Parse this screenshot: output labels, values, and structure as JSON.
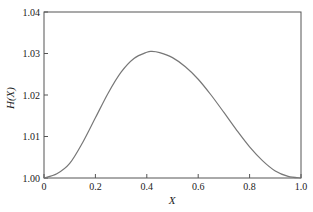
{
  "chart_data": {
    "type": "line",
    "title": "",
    "xlabel": "X",
    "ylabel": "H(X)",
    "xlim": [
      0,
      1.0
    ],
    "ylim": [
      1.0,
      1.04
    ],
    "xticks": [
      "0",
      "0.2",
      "0.4",
      "0.6",
      "0.8",
      "1.0"
    ],
    "yticks": [
      "1.00",
      "1.01",
      "1.02",
      "1.03",
      "1.04"
    ],
    "grid": false,
    "legend": null,
    "series": [
      {
        "name": "H(X)",
        "color": "#777777",
        "x": [
          0,
          0.05,
          0.1,
          0.15,
          0.2,
          0.25,
          0.3,
          0.35,
          0.4,
          0.42,
          0.45,
          0.5,
          0.55,
          0.6,
          0.65,
          0.7,
          0.75,
          0.8,
          0.85,
          0.9,
          0.95,
          1.0
        ],
        "y": [
          1.0,
          1.001,
          1.0035,
          1.0085,
          1.0145,
          1.0205,
          1.0255,
          1.0288,
          1.0303,
          1.0305,
          1.0302,
          1.029,
          1.0268,
          1.0238,
          1.02,
          1.0158,
          1.0115,
          1.0075,
          1.0042,
          1.0017,
          1.0004,
          1.0
        ]
      }
    ]
  }
}
